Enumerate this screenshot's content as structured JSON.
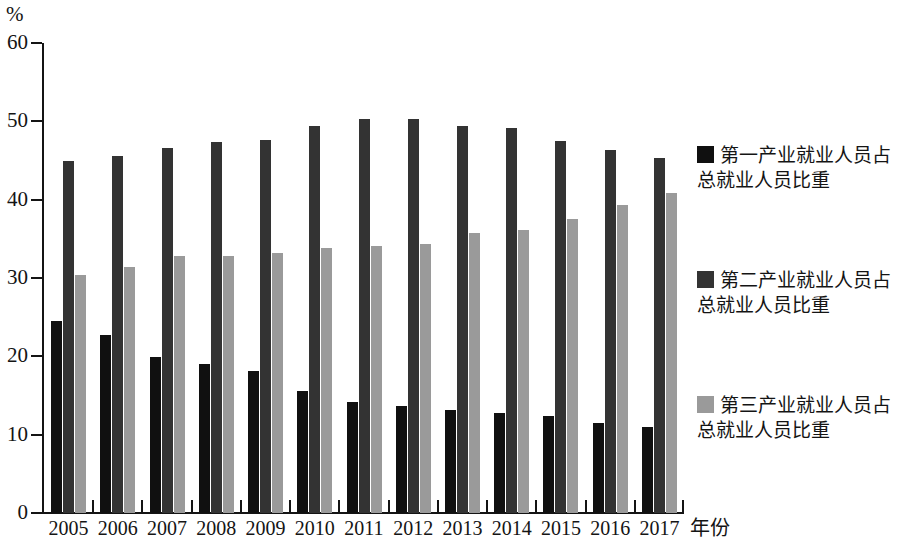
{
  "chart_data": {
    "type": "bar",
    "title": "",
    "subtitle": "",
    "xlabel": "年份",
    "ylabel": "%",
    "y_unit_label": "%",
    "categories": [
      "2005",
      "2006",
      "2007",
      "2008",
      "2009",
      "2010",
      "2011",
      "2012",
      "2013",
      "2014",
      "2015",
      "2016",
      "2017"
    ],
    "ylim": [
      0,
      60
    ],
    "yticks": [
      0,
      10,
      20,
      30,
      40,
      50,
      60
    ],
    "ytick_labels": [
      "0",
      "10",
      "20",
      "30",
      "40",
      "50",
      "60"
    ],
    "grid": false,
    "legend_position": "right",
    "series": [
      {
        "name": "第一产业就业人员占总就业人员比重",
        "color": "#101010",
        "values": [
          24.5,
          22.7,
          19.9,
          19.0,
          18.1,
          15.6,
          14.2,
          13.7,
          13.1,
          12.8,
          12.4,
          11.5,
          11.0
        ]
      },
      {
        "name": "第二产业就业人员占总就业人员比重",
        "color": "#333333",
        "values": [
          45.0,
          45.6,
          46.6,
          47.3,
          47.6,
          49.4,
          50.3,
          50.3,
          49.4,
          49.1,
          47.5,
          46.4,
          45.3
        ]
      },
      {
        "name": "第三产业就业人员占总就业人员比重",
        "color": "#9a9a9a",
        "values": [
          30.4,
          31.4,
          32.8,
          32.8,
          33.2,
          33.8,
          34.1,
          34.3,
          35.7,
          36.1,
          37.5,
          39.3,
          40.9
        ]
      }
    ]
  },
  "legend": {
    "items": [
      {
        "label": "第一产业就业人员占\n总就业人员比重",
        "line1": "第一产业就业人员占",
        "line2": "总就业人员比重",
        "color": "#101010"
      },
      {
        "label": "第二产业就业人员占\n总就业人员比重",
        "line1": "第二产业就业人员占",
        "line2": "总就业人员比重",
        "color": "#333333"
      },
      {
        "label": "第三产业就业人员占\n总就业人员比重",
        "line1": "第三产业就业人员占",
        "line2": "总就业人员比重",
        "color": "#9a9a9a"
      }
    ]
  }
}
